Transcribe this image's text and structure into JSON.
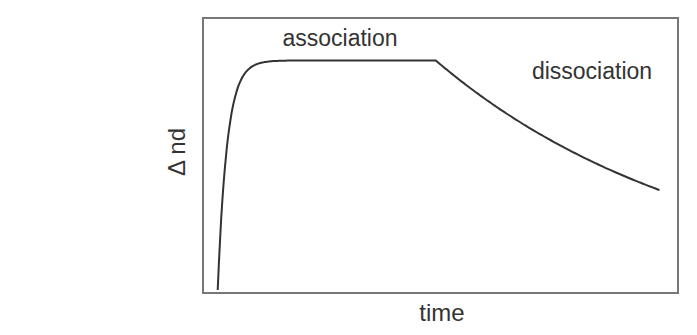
{
  "chart_data": {
    "type": "line",
    "title": "",
    "xlabel": "time",
    "ylabel": "Δ nd",
    "xlim": [
      0,
      100
    ],
    "ylim": [
      0,
      100
    ],
    "grid": false,
    "annotations": [
      {
        "text": "association",
        "x": 30,
        "y": 97
      },
      {
        "text": "dissociation",
        "x": 85,
        "y": 84
      }
    ],
    "series": [
      {
        "name": "binding curve",
        "phases": [
          {
            "name": "association",
            "x_start": 2.7,
            "x_end": 49,
            "start": 0,
            "plateau": 85,
            "rate": 0.5
          },
          {
            "name": "dissociation",
            "x_start": 49,
            "x_end": 96.5,
            "start": 85,
            "rate": 0.0175
          }
        ]
      }
    ],
    "colors": {
      "line": "#333333",
      "axis": "#777777",
      "text": "#333333"
    }
  }
}
